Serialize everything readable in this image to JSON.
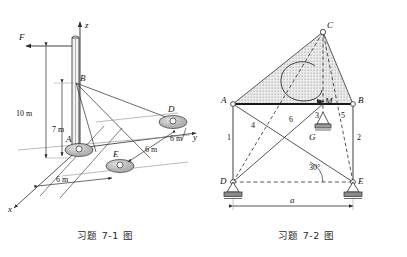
{
  "figure1": {
    "caption": "习题 7-1 图",
    "axes": [
      {
        "name": "z",
        "label": "z"
      },
      {
        "name": "y",
        "label": "y"
      },
      {
        "name": "x",
        "label": "x"
      }
    ],
    "force_label": "F",
    "points": [
      {
        "id": "A",
        "label": "A"
      },
      {
        "id": "B",
        "label": "B"
      },
      {
        "id": "D",
        "label": "D"
      },
      {
        "id": "E",
        "label": "E"
      }
    ],
    "dimensions": [
      {
        "id": "height-10",
        "label": "10 m"
      },
      {
        "id": "height-7",
        "label": "7 m"
      },
      {
        "id": "span-6-x",
        "label": "6 m"
      },
      {
        "id": "span-6-d",
        "label": "6 m"
      },
      {
        "id": "span-6-e",
        "label": "6 m"
      }
    ]
  },
  "figure2": {
    "caption": "习题 7-2 图",
    "points": [
      {
        "id": "A",
        "label": "A"
      },
      {
        "id": "B",
        "label": "B"
      },
      {
        "id": "C",
        "label": "C"
      },
      {
        "id": "D",
        "label": "D"
      },
      {
        "id": "E",
        "label": "E"
      },
      {
        "id": "G",
        "label": "G"
      }
    ],
    "moment_label": "M",
    "members": [
      {
        "id": "1",
        "label": "1"
      },
      {
        "id": "2",
        "label": "2"
      },
      {
        "id": "3",
        "label": "3"
      },
      {
        "id": "4",
        "label": "4"
      },
      {
        "id": "5",
        "label": "5"
      },
      {
        "id": "6",
        "label": "6"
      }
    ],
    "angle_label": "30°",
    "span_label": "a"
  },
  "colors": {
    "line": "#2b2b2b",
    "hatch": "#8a8a8a",
    "fill_light": "#d8d8d8",
    "support": "#6f6f6f"
  }
}
